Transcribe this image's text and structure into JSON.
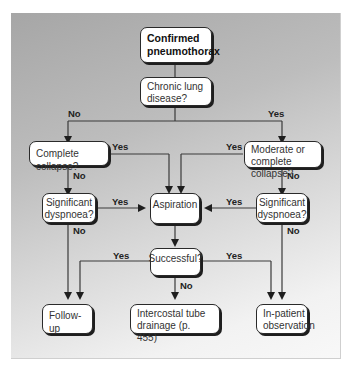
{
  "diagram": {
    "type": "flowchart",
    "nodes": {
      "start": "Confirmed pneumothorax",
      "chronic": "Chronic lung disease?",
      "complete_collapse": "Complete collapse?",
      "moderate_collapse": "Moderate or complete collapse?",
      "dyspnoea_left": "Significant dyspnoea?",
      "aspiration": "Aspiration",
      "dyspnoea_right": "Significant dyspnoea?",
      "successful": "Successful?",
      "follow_up": "Follow-up",
      "tube_drainage": "Intercostal tube drainage (p. 455)",
      "inpatient": "In-patient observation"
    },
    "labels": {
      "chronic_no": "No",
      "chronic_yes": "Yes",
      "complete_yes": "Yes",
      "complete_no": "No",
      "moderate_yes": "Yes",
      "moderate_no": "No",
      "dysp_left_yes": "Yes",
      "dysp_left_no": "No",
      "dysp_right_yes": "Yes",
      "dysp_right_no": "No",
      "success_yes_left": "Yes",
      "success_yes_right": "Yes",
      "success_no": "No"
    },
    "colors": {
      "node_fill": "#ffffff",
      "node_border": "#2a2a2a",
      "line": "#3a3a3a",
      "bg_top": "#a6a6a6",
      "bg_bottom": "#f5f5f5"
    }
  }
}
